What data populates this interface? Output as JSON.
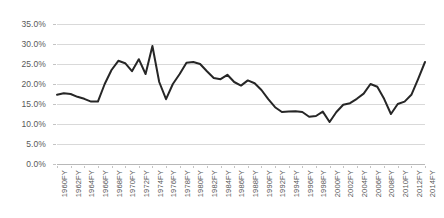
{
  "chart_data": {
    "type": "line",
    "title": "",
    "xlabel": "",
    "ylabel": "",
    "ylim": [
      0,
      0.35
    ],
    "y_ticks": [
      0.0,
      0.05,
      0.1,
      0.15,
      0.2,
      0.25,
      0.3,
      0.35
    ],
    "y_tick_labels": [
      "0.0%",
      "5.0%",
      "10.0%",
      "15.0%",
      "20.0%",
      "25.0%",
      "30.0%",
      "35.0%"
    ],
    "grid": true,
    "legend": "none",
    "x_tick_labels": [
      "1960FY",
      "1962FY",
      "1964FY",
      "1966FY",
      "1968FY",
      "1970FY",
      "1972FY",
      "1974FY",
      "1976FY",
      "1978FY",
      "1980FY",
      "1982FY",
      "1984FY",
      "1986FY",
      "1988FY",
      "1990FY",
      "1992FY",
      "1994FY",
      "1996FY",
      "1998FY",
      "2000FY",
      "2002FY",
      "2004FY",
      "2006FY",
      "2008FY",
      "2010FY",
      "2012FY",
      "2014FY"
    ],
    "x": [
      "1960FY",
      "1961FY",
      "1962FY",
      "1963FY",
      "1964FY",
      "1965FY",
      "1966FY",
      "1967FY",
      "1968FY",
      "1969FY",
      "1970FY",
      "1971FY",
      "1972FY",
      "1973FY",
      "1974FY",
      "1975FY",
      "1976FY",
      "1977FY",
      "1978FY",
      "1979FY",
      "1980FY",
      "1981FY",
      "1982FY",
      "1983FY",
      "1984FY",
      "1985FY",
      "1986FY",
      "1987FY",
      "1988FY",
      "1989FY",
      "1990FY",
      "1991FY",
      "1992FY",
      "1993FY",
      "1994FY",
      "1995FY",
      "1996FY",
      "1997FY",
      "1998FY",
      "1999FY",
      "2000FY",
      "2001FY",
      "2002FY",
      "2003FY",
      "2004FY",
      "2005FY",
      "2006FY",
      "2007FY",
      "2008FY",
      "2009FY",
      "2010FY",
      "2011FY",
      "2012FY",
      "2013FY",
      "2014FY"
    ],
    "values": [
      0.173,
      0.177,
      0.175,
      0.168,
      0.163,
      0.156,
      0.156,
      0.2,
      0.235,
      0.258,
      0.252,
      0.232,
      0.262,
      0.225,
      0.295,
      0.205,
      0.162,
      0.2,
      0.225,
      0.253,
      0.255,
      0.25,
      0.232,
      0.215,
      0.212,
      0.223,
      0.205,
      0.196,
      0.209,
      0.202,
      0.185,
      0.162,
      0.142,
      0.13,
      0.131,
      0.132,
      0.13,
      0.118,
      0.12,
      0.131,
      0.105,
      0.13,
      0.148,
      0.152,
      0.163,
      0.176,
      0.2,
      0.193,
      0.163,
      0.125,
      0.15,
      0.156,
      0.173,
      0.213,
      0.255
    ],
    "series_name": "Rate",
    "series_color": "#262626"
  },
  "axes": {
    "grid_color": "#d9d9d9",
    "tick_label_color": "#595959"
  }
}
